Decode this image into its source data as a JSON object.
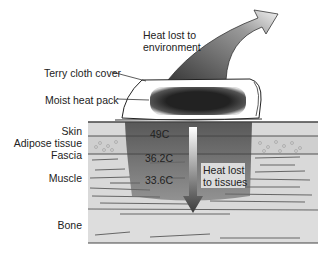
{
  "diagram": {
    "title_arrow_env": {
      "line1": "Heat lost to",
      "line2": "environment"
    },
    "cover_label": "Terry cloth cover",
    "pack_label": "Moist heat pack",
    "tissue_labels": [
      "Skin",
      "Adipose tissue",
      "Fascia",
      "Muscle",
      "Bone"
    ],
    "temperatures": {
      "skin": "49C",
      "fascia": "36.2C",
      "muscle": "33.6C"
    },
    "tissue_arrow": {
      "line1": "Heat lost",
      "line2": "to tissues"
    },
    "colors": {
      "tissue_base": "#d6d6d6",
      "heated_region": "#6e6e6e",
      "pack_core": "#2a2a2a",
      "lines": "#555555"
    }
  }
}
